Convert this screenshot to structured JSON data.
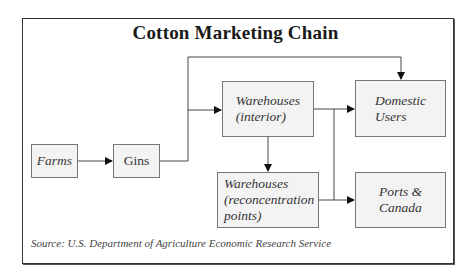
{
  "diagram": {
    "title": "Cotton Marketing Chain",
    "nodes": {
      "farms": "Farms",
      "gins": "Gins",
      "warehouses_interior": "Warehouses\n(interior)",
      "domestic_users": "Domestic\nUsers",
      "warehouses_reconcentration": "Warehouses\n(reconcentration\npoints)",
      "ports_canada": "Ports &\nCanada"
    },
    "edges": [
      [
        "Farms",
        "Gins"
      ],
      [
        "Gins",
        "Warehouses (interior)"
      ],
      [
        "Gins",
        "Domestic Users"
      ],
      [
        "Warehouses (interior)",
        "Domestic Users"
      ],
      [
        "Warehouses (interior)",
        "Warehouses (reconcentration points)"
      ],
      [
        "Warehouses (interior)",
        "Ports & Canada"
      ],
      [
        "Warehouses (reconcentration points)",
        "Ports & Canada"
      ]
    ],
    "source": "Source: U.S. Department of Agriculture Economic Research Service",
    "colors": {
      "box_fill": "#f3f3f3",
      "box_border": "#777777",
      "line": "#333333"
    }
  }
}
